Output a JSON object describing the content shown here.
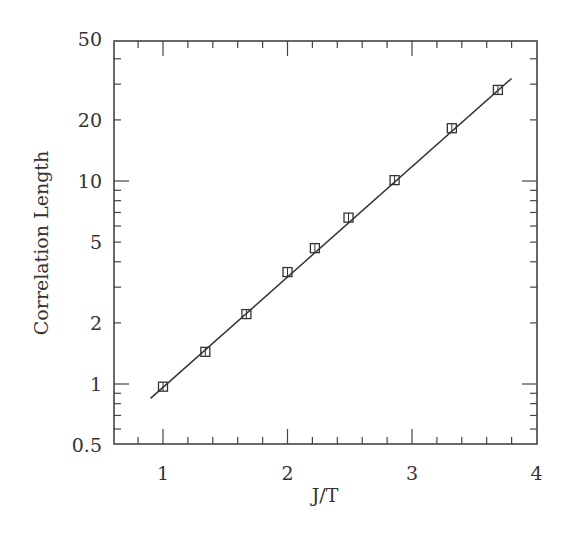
{
  "chart_data": {
    "type": "scatter",
    "title": "",
    "xlabel": "J/T",
    "ylabel": "Correlation Length",
    "xlim": [
      0.67,
      4.0
    ],
    "ylim": [
      0.5,
      50
    ],
    "yscale": "log",
    "grid": false,
    "legend": null,
    "x_ticks": [
      1,
      2,
      3,
      4
    ],
    "x_tick_labels": [
      "1",
      "2",
      "3",
      "4"
    ],
    "x_minor_step": 0.2,
    "y_ticks": [
      0.5,
      1,
      2,
      5,
      10,
      20,
      50
    ],
    "y_tick_labels": [
      "0.5",
      "1",
      "2",
      "5",
      "10",
      "20",
      "50"
    ],
    "series": [
      {
        "name": "data",
        "marker": "square",
        "x": [
          1.0,
          1.34,
          1.67,
          2.0,
          2.22,
          2.49,
          2.86,
          3.32,
          3.69
        ],
        "y": [
          0.97,
          1.44,
          2.21,
          3.56,
          4.67,
          6.6,
          10.1,
          18.2,
          28.1
        ]
      },
      {
        "name": "fit",
        "style": "line",
        "x": [
          0.9,
          3.8
        ],
        "y": [
          0.85,
          32.0
        ]
      }
    ]
  },
  "labels": {
    "xlabel": "J/T",
    "ylabel": "Correlation Length"
  }
}
